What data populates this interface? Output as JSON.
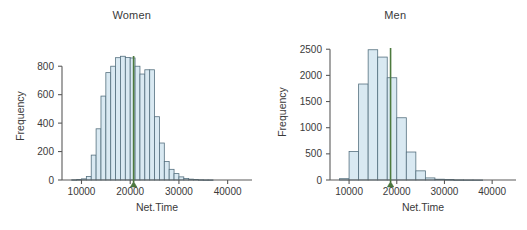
{
  "figure": {
    "background": "#ffffff",
    "bar_fill": "#d9e9f2",
    "bar_stroke": "#55707f",
    "median_color": "#4d7a3e",
    "axis_color": "#5a5a5a",
    "text_color": "#3a3a3a"
  },
  "chart_data": [
    {
      "type": "bar",
      "title": "Women",
      "xlabel": "Net.Time",
      "ylabel": "Frequency",
      "xlim": [
        6000,
        45000
      ],
      "ylim": [
        0,
        900
      ],
      "xticks": [
        10000,
        20000,
        30000,
        40000
      ],
      "xticklabels": [
        "10000",
        "20000",
        "30000",
        "40000"
      ],
      "yticks": [
        0,
        200,
        400,
        600,
        800
      ],
      "yticklabels": [
        "0",
        "200",
        "400",
        "600",
        "800"
      ],
      "grid": false,
      "legend": "none",
      "bin_width": 1000,
      "bin_starts": [
        8000,
        9000,
        10000,
        11000,
        12000,
        13000,
        14000,
        15000,
        16000,
        17000,
        18000,
        19000,
        20000,
        21000,
        22000,
        23000,
        24000,
        25000,
        26000,
        27000,
        28000,
        29000,
        30000,
        31000,
        32000,
        33000,
        34000,
        35000,
        36000
      ],
      "values": [
        2,
        3,
        8,
        25,
        175,
        360,
        590,
        755,
        800,
        860,
        870,
        862,
        858,
        800,
        745,
        775,
        775,
        445,
        260,
        130,
        75,
        45,
        22,
        10,
        6,
        4,
        2,
        1,
        1
      ],
      "annotations": [
        {
          "name": "median-line",
          "x": 20700,
          "label": "median marker"
        }
      ]
    },
    {
      "type": "bar",
      "title": "Men",
      "xlabel": "Net.Time",
      "ylabel": "Frequency",
      "xlim": [
        6000,
        45000
      ],
      "ylim": [
        0,
        2600
      ],
      "xticks": [
        10000,
        20000,
        30000,
        40000
      ],
      "xticklabels": [
        "10000",
        "20000",
        "30000",
        "40000"
      ],
      "yticks": [
        0,
        500,
        1000,
        1500,
        2000,
        2500
      ],
      "yticklabels": [
        "0",
        "500",
        "1000",
        "1500",
        "2000",
        "2500"
      ],
      "grid": false,
      "legend": "none",
      "bin_width": 2000,
      "bin_starts": [
        8000,
        10000,
        12000,
        14000,
        16000,
        18000,
        20000,
        22000,
        24000,
        26000,
        28000,
        30000,
        32000,
        34000,
        36000
      ],
      "values": [
        25,
        545,
        1835,
        2490,
        2350,
        1955,
        1190,
        535,
        175,
        40,
        15,
        8,
        4,
        2,
        1
      ],
      "annotations": [
        {
          "name": "median-line",
          "x": 18700,
          "label": "median marker"
        }
      ]
    }
  ]
}
